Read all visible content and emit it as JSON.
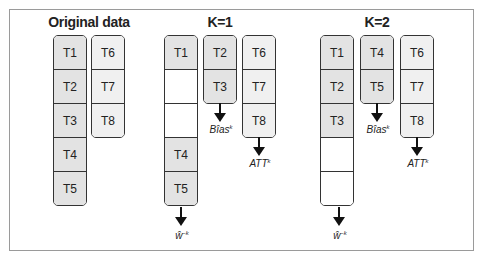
{
  "panels": {
    "original": {
      "title": "Original data",
      "col1": [
        "T1",
        "T2",
        "T3",
        "T4",
        "T5"
      ],
      "col2": [
        "T6",
        "T7",
        "T8"
      ]
    },
    "k1": {
      "title": "K=1",
      "col1": [
        "T1",
        "",
        "",
        "T4",
        "T5"
      ],
      "col2": [
        "T2",
        "T3"
      ],
      "col3": [
        "T6",
        "T7",
        "T8"
      ],
      "labels": {
        "w_base": "ŵ",
        "w_sup": "−k",
        "bias_base": "Bîas",
        "bias_sup": "k",
        "att_base": "ATT",
        "att_sup": "k"
      }
    },
    "k2": {
      "title": "K=2",
      "col1": [
        "T1",
        "T2",
        "T3",
        "",
        ""
      ],
      "col2": [
        "T4",
        "T5"
      ],
      "col3": [
        "T6",
        "T7",
        "T8"
      ],
      "labels": {
        "w_base": "ŵ",
        "w_sup": "−k",
        "bias_base": "Bîas",
        "bias_sup": "k",
        "att_base": "ATT",
        "att_sup": "k"
      }
    }
  },
  "colors": {
    "dark_cell": "#e3e3e3",
    "light_cell": "#f0f0f0",
    "border": "#333333",
    "frame": "#9a9a9a"
  }
}
